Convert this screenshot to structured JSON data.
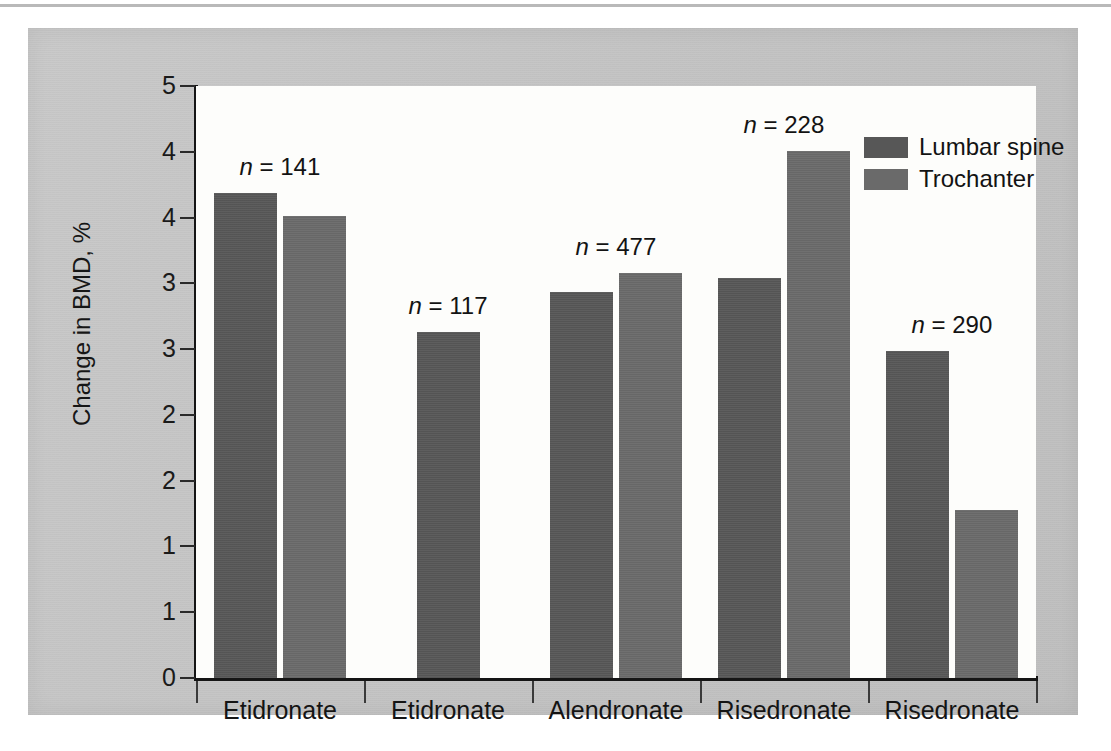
{
  "chart_data": {
    "type": "bar",
    "title": "",
    "xlabel": "",
    "ylabel": "Change in BMD, %",
    "ylim": [
      0,
      5
    ],
    "grid": false,
    "legend_position": "top-right",
    "categories": [
      "Etidronate",
      "Etidronate",
      "Alendronate",
      "Risedronate",
      "Risedronate"
    ],
    "y_tick_labels": [
      "5",
      "4",
      "4",
      "3",
      "3",
      "2",
      "2",
      "1",
      "1",
      "0"
    ],
    "y_tick_values": [
      5.0,
      4.5,
      4.0,
      3.5,
      3.0,
      2.5,
      2.0,
      1.5,
      1.0,
      0.0
    ],
    "series": [
      {
        "name": "Lumbar spine",
        "color": "#575757",
        "values": [
          4.1,
          2.92,
          3.26,
          3.38,
          2.76
        ]
      },
      {
        "name": "Trochanter",
        "color": "#6a6a6a",
        "values": [
          3.9,
          null,
          3.42,
          4.45,
          1.42
        ]
      }
    ],
    "annotations": [
      {
        "group": 0,
        "label_prefix": "n",
        "equals": "=",
        "value": "141"
      },
      {
        "group": 1,
        "label_prefix": "n",
        "equals": "=",
        "value": "117"
      },
      {
        "group": 2,
        "label_prefix": "n",
        "equals": "=",
        "value": "477"
      },
      {
        "group": 3,
        "label_prefix": "n",
        "equals": "=",
        "value": "228"
      },
      {
        "group": 4,
        "label_prefix": "n",
        "equals": "=",
        "value": "290"
      }
    ]
  },
  "axis": {
    "y_title": "Change in BMD, %",
    "y_ticks": [
      {
        "label": "5"
      },
      {
        "label": "4"
      },
      {
        "label": "4"
      },
      {
        "label": "3"
      },
      {
        "label": "3"
      },
      {
        "label": "2"
      },
      {
        "label": "2"
      },
      {
        "label": "1"
      },
      {
        "label": "1"
      },
      {
        "label": "0"
      }
    ],
    "x_ticks": [
      {
        "label": "Etidronate"
      },
      {
        "label": "Etidronate"
      },
      {
        "label": "Alendronate"
      },
      {
        "label": "Risedronate"
      },
      {
        "label": "Risedronate"
      }
    ]
  },
  "legend": {
    "entries": [
      {
        "label": "Lumbar spine",
        "color": "#575757"
      },
      {
        "label": "Trochanter",
        "color": "#6a6a6a"
      }
    ]
  },
  "annotations": [
    {
      "text": "n = 141"
    },
    {
      "text": "n = 117"
    },
    {
      "text": "n = 477"
    },
    {
      "text": "n = 228"
    },
    {
      "text": "n = 290"
    }
  ],
  "colors": {
    "page_background": "#ffffff",
    "panel_background": "#c4c4c4",
    "plot_background": "#fdfdfb",
    "axis": "#151515",
    "lumbar_spine": "#575757",
    "trochanter": "#6a6a6a"
  }
}
